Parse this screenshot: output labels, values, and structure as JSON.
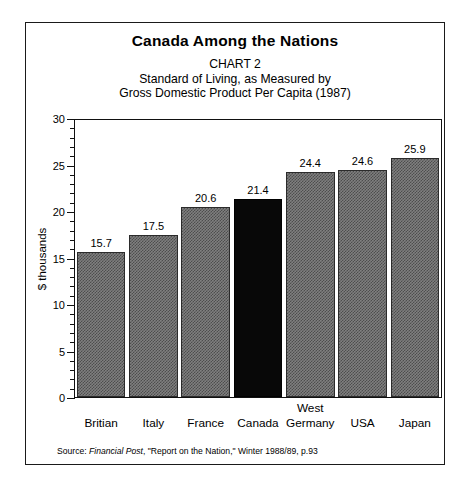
{
  "chart_data": {
    "type": "bar",
    "title": "Canada Among the Nations",
    "chart_number": "CHART 2",
    "subtitle_line_1": "Standard of Living, as Measured by",
    "subtitle_line_2": "Gross Domestic Product Per Capita (1987)",
    "categories": [
      "Britian",
      "Italy",
      "France",
      "Canada",
      "West Germany",
      "USA",
      "Japan"
    ],
    "category_label_lines": [
      {
        "top": "",
        "main": "Britian"
      },
      {
        "top": "",
        "main": "Italy"
      },
      {
        "top": "",
        "main": "France"
      },
      {
        "top": "",
        "main": "Canada"
      },
      {
        "top": "West",
        "main": "Germany"
      },
      {
        "top": "",
        "main": "USA"
      },
      {
        "top": "",
        "main": "Japan"
      }
    ],
    "values": [
      15.7,
      17.5,
      20.6,
      21.4,
      24.4,
      24.6,
      25.9
    ],
    "value_labels": [
      "15.7",
      "17.5",
      "20.6",
      "21.4",
      "24.4",
      "24.6",
      "25.9"
    ],
    "highlight_index": 3,
    "xlabel": "",
    "ylabel": "$ thousands",
    "ylim": [
      0,
      30
    ],
    "y_major_ticks": [
      0,
      5,
      10,
      15,
      20,
      25,
      30
    ],
    "y_major_tick_labels": [
      "0",
      "5",
      "10",
      "15",
      "20",
      "25",
      "30"
    ],
    "y_minor_tick_step": 1,
    "grid": false,
    "legend": "none",
    "bar_color": "#7f7f7f",
    "highlight_color": "#000000",
    "frame_color": "#1a1a1a",
    "background_color": "#ffffff"
  },
  "source": {
    "prefix": "Source: ",
    "italic_part": "Financial Post",
    "suffix": ", \"Report on the Nation,\" Winter 1988/89, p.93"
  }
}
